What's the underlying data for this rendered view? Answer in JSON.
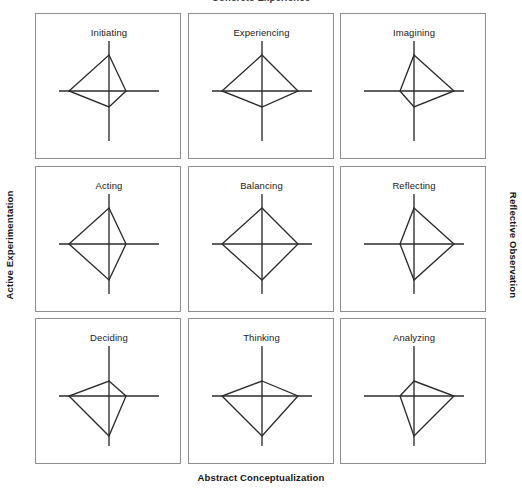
{
  "figure": {
    "top_title": "Concrete Experience",
    "bottom_label": "Abstract Conceptualization",
    "left_label": "Active Experimentation",
    "right_label": "Reflective Observation",
    "line_color": "#2b2b2b",
    "panel_border_color": "#8d8d8d",
    "background_color": "#ffffff"
  },
  "chart_data": {
    "type": "radar",
    "title": "Concrete Experience",
    "xlabel": "Abstract Conceptualization",
    "ylabel": "Active Experimentation",
    "ylabel_right": "Reflective Observation",
    "grid": false,
    "legend": "none",
    "axes": [
      "up",
      "right",
      "down",
      "left"
    ],
    "axis_names": {
      "up": "Concrete Experience",
      "right": "Reflective Observation",
      "down": "Abstract Conceptualization",
      "left": "Active Experimentation"
    },
    "axis_half_length": 50,
    "value_range": [
      0,
      50
    ],
    "panels": [
      {
        "label": "Initiating",
        "row": 1,
        "col": 1,
        "values": {
          "up": 36,
          "right": 17,
          "down": 16,
          "left": 40
        }
      },
      {
        "label": "Experiencing",
        "row": 1,
        "col": 2,
        "values": {
          "up": 36,
          "right": 36,
          "down": 16,
          "left": 40
        }
      },
      {
        "label": "Imagining",
        "row": 1,
        "col": 3,
        "values": {
          "up": 36,
          "right": 40,
          "down": 16,
          "left": 14
        }
      },
      {
        "label": "Acting",
        "row": 2,
        "col": 1,
        "values": {
          "up": 36,
          "right": 17,
          "down": 36,
          "left": 40
        }
      },
      {
        "label": "Balancing",
        "row": 2,
        "col": 2,
        "values": {
          "up": 36,
          "right": 36,
          "down": 36,
          "left": 40
        }
      },
      {
        "label": "Reflecting",
        "row": 2,
        "col": 3,
        "values": {
          "up": 36,
          "right": 40,
          "down": 36,
          "left": 14
        }
      },
      {
        "label": "Deciding",
        "row": 3,
        "col": 1,
        "values": {
          "up": 15,
          "right": 17,
          "down": 40,
          "left": 40
        }
      },
      {
        "label": "Thinking",
        "row": 3,
        "col": 2,
        "values": {
          "up": 15,
          "right": 36,
          "down": 40,
          "left": 40
        }
      },
      {
        "label": "Analyzing",
        "row": 3,
        "col": 3,
        "values": {
          "up": 15,
          "right": 40,
          "down": 40,
          "left": 14
        }
      }
    ]
  }
}
